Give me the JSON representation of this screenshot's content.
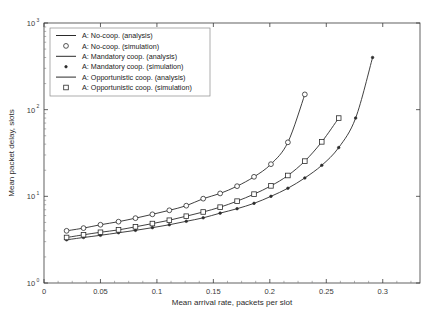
{
  "chart_data": {
    "type": "line",
    "title": "",
    "xlabel": "Mean arrival rate, packets per slot",
    "ylabel": "Mean packet delay, slots",
    "xlim": [
      0,
      0.333
    ],
    "ylim": [
      1,
      1000
    ],
    "yscale": "log",
    "xscale": "linear",
    "grid": false,
    "legend_position": "upper-left",
    "xticks": [
      "0",
      "0.05",
      "0.1",
      "0.15",
      "0.2",
      "0.25",
      "0.3"
    ],
    "xtick_values": [
      0,
      0.05,
      0.1,
      0.15,
      0.2,
      0.25,
      0.3
    ],
    "ytick_labels": [
      "10",
      "10",
      "10",
      "10"
    ],
    "ytick_exponents": [
      "0",
      "1",
      "2",
      "3"
    ],
    "ytick_values": [
      1,
      10,
      100,
      1000
    ],
    "series": [
      {
        "name": "A: No-coop. (analysis)",
        "marker": "none",
        "style": "line",
        "x": [
          0.02,
          0.035,
          0.05,
          0.066,
          0.081,
          0.096,
          0.111,
          0.126,
          0.141,
          0.156,
          0.171,
          0.186,
          0.201,
          0.216,
          0.231
        ],
        "y": [
          4.0,
          4.3,
          4.7,
          5.1,
          5.6,
          6.2,
          6.9,
          7.8,
          9.4,
          10.8,
          13.1,
          16.8,
          23.5,
          42.0,
          150.0
        ]
      },
      {
        "name": "A: No-coop. (simulation)",
        "marker": "circle",
        "style": "marker",
        "x": [
          0.02,
          0.035,
          0.05,
          0.066,
          0.081,
          0.096,
          0.111,
          0.126,
          0.141,
          0.156,
          0.171,
          0.186,
          0.201,
          0.216,
          0.231
        ],
        "y": [
          4.0,
          4.3,
          4.7,
          5.1,
          5.6,
          6.2,
          6.9,
          7.8,
          9.4,
          10.8,
          13.1,
          16.8,
          23.5,
          42.0,
          150.0
        ]
      },
      {
        "name": "A: Mandatory coop. (analysis)",
        "marker": "none",
        "style": "line",
        "x": [
          0.02,
          0.035,
          0.05,
          0.066,
          0.081,
          0.096,
          0.111,
          0.126,
          0.141,
          0.156,
          0.171,
          0.186,
          0.201,
          0.216,
          0.231,
          0.246,
          0.261,
          0.276,
          0.291
        ],
        "y": [
          3.15,
          3.35,
          3.55,
          3.8,
          4.05,
          4.35,
          4.7,
          5.15,
          5.65,
          6.4,
          7.2,
          8.3,
          10.0,
          12.4,
          16.3,
          22.8,
          36.5,
          80.0,
          400.0
        ]
      },
      {
        "name": "A: Mandatory coop. (simulation)",
        "marker": "dot",
        "style": "marker",
        "x": [
          0.02,
          0.035,
          0.05,
          0.066,
          0.081,
          0.096,
          0.111,
          0.126,
          0.141,
          0.156,
          0.171,
          0.186,
          0.201,
          0.216,
          0.231,
          0.246,
          0.261,
          0.276,
          0.291
        ],
        "y": [
          3.15,
          3.35,
          3.55,
          3.8,
          4.05,
          4.35,
          4.7,
          5.15,
          5.65,
          6.4,
          7.2,
          8.3,
          10.0,
          12.4,
          16.3,
          22.8,
          36.5,
          80.0,
          400.0
        ]
      },
      {
        "name": "A: Opportunistic coop. (analysis)",
        "marker": "none",
        "style": "line",
        "x": [
          0.02,
          0.035,
          0.05,
          0.066,
          0.081,
          0.096,
          0.111,
          0.126,
          0.141,
          0.156,
          0.171,
          0.186,
          0.201,
          0.216,
          0.231,
          0.246,
          0.261
        ],
        "y": [
          3.35,
          3.6,
          3.85,
          4.1,
          4.45,
          4.85,
          5.3,
          5.9,
          6.6,
          7.5,
          8.8,
          10.6,
          13.2,
          17.4,
          25.5,
          42.5,
          80.0
        ]
      },
      {
        "name": "A: Opportunistic coop. (simulation)",
        "marker": "square",
        "style": "marker",
        "x": [
          0.02,
          0.035,
          0.05,
          0.066,
          0.081,
          0.096,
          0.111,
          0.126,
          0.141,
          0.156,
          0.171,
          0.186,
          0.201,
          0.216,
          0.231,
          0.246,
          0.261
        ],
        "y": [
          3.35,
          3.6,
          3.85,
          4.1,
          4.45,
          4.85,
          5.3,
          5.9,
          6.6,
          7.5,
          8.8,
          10.6,
          13.2,
          17.4,
          25.5,
          42.5,
          80.0
        ]
      }
    ],
    "legend_entries": [
      {
        "label": "A: No-coop. (analysis)",
        "marker": "line"
      },
      {
        "label": "A: No-coop. (simulation)",
        "marker": "circle"
      },
      {
        "label": "A: Mandatory coop. (analysis)",
        "marker": "line"
      },
      {
        "label": "A: Mandatory coop. (simulation)",
        "marker": "dot"
      },
      {
        "label": "A: Opportunistic coop. (analysis)",
        "marker": "line"
      },
      {
        "label": "A: Opportunistic coop. (simulation)",
        "marker": "square"
      }
    ],
    "colors": {
      "axis": "#3a3a3a",
      "curve": "#2b2b2b",
      "background": "#ffffff",
      "legend_border": "#8a8a8a"
    }
  }
}
